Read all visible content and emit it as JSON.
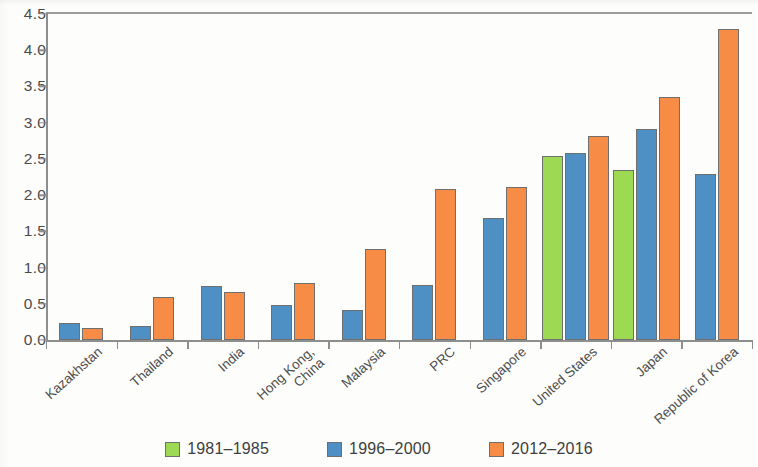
{
  "chart_data": {
    "type": "bar",
    "title": "",
    "xlabel": "",
    "ylabel": "",
    "ylim": [
      0.0,
      4.5
    ],
    "ytick_labels": [
      "0.0",
      "0.5",
      "1.0",
      "1.5",
      "2.0",
      "2.5",
      "3.0",
      "3.5",
      "4.0",
      "4.5"
    ],
    "ytick_values": [
      0.0,
      0.5,
      1.0,
      1.5,
      2.0,
      2.5,
      3.0,
      3.5,
      4.0,
      4.5
    ],
    "grid": false,
    "legend_position": "bottom",
    "categories": [
      "Kazakhstan",
      "Thailand",
      "India",
      "Hong Kong, China",
      "Malaysia",
      "PRC",
      "Singapore",
      "United States",
      "Japan",
      "Republic of Korea"
    ],
    "category_lines": [
      [
        "Kazakhstan"
      ],
      [
        "Thailand"
      ],
      [
        "India"
      ],
      [
        "Hong Kong,",
        "China"
      ],
      [
        "Malaysia"
      ],
      [
        "PRC"
      ],
      [
        "Singapore"
      ],
      [
        "United States"
      ],
      [
        "Japan"
      ],
      [
        "Republic of Korea"
      ]
    ],
    "series": [
      {
        "name": "1981-1985",
        "color": "#9ed954",
        "values": [
          null,
          null,
          null,
          null,
          null,
          null,
          null,
          2.54,
          2.34,
          null
        ]
      },
      {
        "name": "1996-2000",
        "color": "#4f90c4",
        "values": [
          0.23,
          0.2,
          0.74,
          0.49,
          0.42,
          0.76,
          1.69,
          2.58,
          2.91,
          2.29
        ]
      },
      {
        "name": "2012-2016",
        "color": "#f68c45",
        "values": [
          0.17,
          0.6,
          0.66,
          0.79,
          1.26,
          2.08,
          2.11,
          2.81,
          3.35,
          4.29
        ]
      }
    ],
    "legend": [
      {
        "label": "1981–1985",
        "color": "#9ed954"
      },
      {
        "label": "1996–2000",
        "color": "#4f90c4"
      },
      {
        "label": "2012–2016",
        "color": "#f68c45"
      }
    ]
  }
}
